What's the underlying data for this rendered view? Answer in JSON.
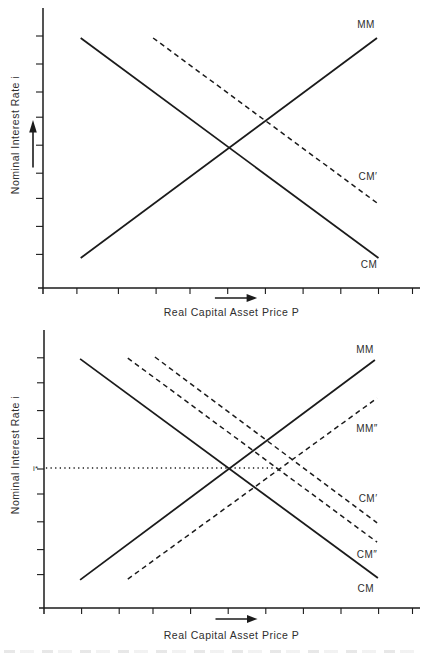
{
  "colors": {
    "line": "#1b1b1b",
    "text": "#2e2e2e",
    "background": "#ffffff"
  },
  "icons": {
    "y_axis_arrow": "up-arrow",
    "x_axis_arrow": "right-arrow"
  },
  "chart_data": [
    {
      "type": "line",
      "title": "",
      "xlabel": "Real Capital Asset Price P",
      "ylabel": "Nominal Interest Rate i",
      "x_range": [
        0,
        10
      ],
      "y_range": [
        0,
        10
      ],
      "grid": false,
      "legend": "labels-on-curves",
      "x_ticks": [
        0.9,
        2.0,
        3.0,
        3.9,
        4.9,
        5.9,
        6.9,
        7.9,
        8.9,
        9.8
      ],
      "y_ticks": [
        1.2,
        2.2,
        3.2,
        4.1,
        5.1,
        6.1,
        7.0,
        8.0,
        9.0
      ],
      "series": [
        {
          "id": "mm",
          "name": "MM",
          "style": "solid",
          "points": [
            [
              1.0,
              1.07
            ],
            [
              8.86,
              8.93
            ]
          ],
          "label_at": [
            8.57,
            9.3
          ]
        },
        {
          "id": "cm-prime",
          "name": "CM'",
          "style": "dashed",
          "points": [
            [
              2.92,
              8.93
            ],
            [
              8.86,
              3.04
            ]
          ],
          "label_at": [
            8.62,
            3.86
          ]
        },
        {
          "id": "cm",
          "name": "CM",
          "style": "solid",
          "points": [
            [
              1.0,
              8.93
            ],
            [
              8.9,
              1.07
            ]
          ],
          "label_at": [
            8.65,
            0.71
          ]
        }
      ],
      "annotations": []
    },
    {
      "type": "line",
      "title": "",
      "xlabel": "Real Capital Asset Price P",
      "ylabel": "Nominal Interest Rate i",
      "x_range": [
        0,
        10
      ],
      "y_range": [
        0,
        10
      ],
      "grid": false,
      "legend": "labels-on-curves",
      "x_ticks": [
        1.0,
        2.0,
        2.9,
        3.9,
        4.9,
        5.9,
        6.9,
        7.9,
        8.9,
        9.8
      ],
      "y_ticks": [
        1.2,
        2.1,
        3.1,
        4.1,
        5.0,
        6.1,
        7.1,
        8.1,
        9.0
      ],
      "series": [
        {
          "id": "mm",
          "name": "MM",
          "style": "solid",
          "points": [
            [
              0.96,
              1.01
            ],
            [
              8.8,
              8.92
            ]
          ],
          "label_at": [
            8.54,
            9.17
          ]
        },
        {
          "id": "mm-double-prime",
          "name": "MM\"",
          "style": "dashed",
          "points": [
            [
              2.23,
              1.04
            ],
            [
              8.86,
              7.55
            ]
          ],
          "label_at": [
            8.59,
            6.33
          ]
        },
        {
          "id": "cm-prime",
          "name": "CM'",
          "style": "dashed",
          "points": [
            [
              2.95,
              9.03
            ],
            [
              8.86,
              3.06
            ]
          ],
          "label_at": [
            8.62,
            3.81
          ]
        },
        {
          "id": "cm-double-prime",
          "name": "CM\"",
          "style": "dashed",
          "points": [
            [
              2.23,
              8.99
            ],
            [
              8.86,
              2.37
            ]
          ],
          "label_at": [
            8.59,
            1.8
          ]
        },
        {
          "id": "cm",
          "name": "CM",
          "style": "solid",
          "points": [
            [
              0.96,
              8.96
            ],
            [
              8.88,
              1.08
            ]
          ],
          "label_at": [
            8.56,
            0.58
          ]
        },
        {
          "id": "i-star-level",
          "name": "",
          "style": "dotted",
          "points": [
            [
              0.05,
              5.04
            ],
            [
              6.28,
              5.04
            ]
          ]
        }
      ],
      "annotations": [
        {
          "id": "i-star",
          "text": "i*",
          "x": -0.16,
          "y": 4.93,
          "anchor": "end",
          "size": 8
        }
      ]
    }
  ]
}
